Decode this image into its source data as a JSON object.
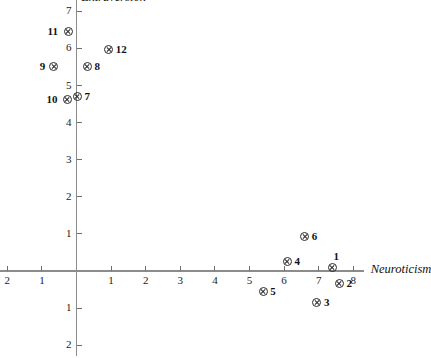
{
  "chart_data": {
    "type": "scatter",
    "title": "",
    "xlabel": "Neuroticism",
    "ylabel": "Extraversion",
    "xlim": [
      -2.3,
      8.3
    ],
    "ylim": [
      -2.3,
      7.3
    ],
    "grid": false,
    "legend": "none",
    "x_ticks": [
      {
        "value": -2,
        "label": "2"
      },
      {
        "value": -1,
        "label": "1"
      },
      {
        "value": 1,
        "label": "1"
      },
      {
        "value": 2,
        "label": "2"
      },
      {
        "value": 3,
        "label": "3"
      },
      {
        "value": 4,
        "label": "4"
      },
      {
        "value": 5,
        "label": "5"
      },
      {
        "value": 6,
        "label": "6"
      },
      {
        "value": 7,
        "label": "7"
      },
      {
        "value": 8,
        "label": "8"
      }
    ],
    "y_ticks": [
      {
        "value": 7,
        "label": "7"
      },
      {
        "value": 6,
        "label": "6"
      },
      {
        "value": 5,
        "label": "5"
      },
      {
        "value": 4,
        "label": "4"
      },
      {
        "value": 3,
        "label": "3"
      },
      {
        "value": 2,
        "label": "2"
      },
      {
        "value": 1,
        "label": "1"
      },
      {
        "value": -1,
        "label": "1"
      },
      {
        "value": -2,
        "label": "2"
      }
    ],
    "points": [
      {
        "label": "1",
        "x": 7.4,
        "y": 0.1,
        "label_pos": "above-right"
      },
      {
        "label": "2",
        "x": 7.6,
        "y": -0.35,
        "label_pos": "right"
      },
      {
        "label": "3",
        "x": 6.95,
        "y": -0.85,
        "label_pos": "right"
      },
      {
        "label": "4",
        "x": 6.1,
        "y": 0.25,
        "label_pos": "right"
      },
      {
        "label": "5",
        "x": 5.4,
        "y": -0.55,
        "label_pos": "right"
      },
      {
        "label": "6",
        "x": 6.6,
        "y": 0.92,
        "label_pos": "right"
      },
      {
        "label": "7",
        "x": 0.03,
        "y": 4.7,
        "label_pos": "right"
      },
      {
        "label": "8",
        "x": 0.32,
        "y": 5.52,
        "label_pos": "right"
      },
      {
        "label": "9",
        "x": -0.66,
        "y": 5.52,
        "label_pos": "left"
      },
      {
        "label": "10",
        "x": -0.26,
        "y": 4.62,
        "label_pos": "left"
      },
      {
        "label": "11",
        "x": -0.23,
        "y": 6.46,
        "label_pos": "left"
      },
      {
        "label": "12",
        "x": 0.93,
        "y": 5.97,
        "label_pos": "right"
      }
    ]
  },
  "colors": {
    "axis": "#8c8c8c",
    "tick": "#6e6e6e",
    "text": "#111111",
    "marker": "#2b2b2b",
    "background": "#ffffff"
  }
}
